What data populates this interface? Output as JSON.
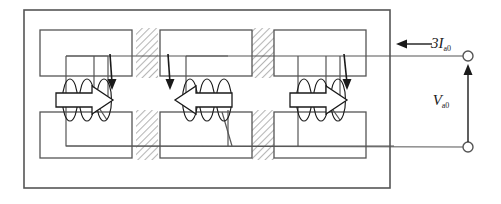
{
  "figure": {
    "type": "circuit-magnetic-diagram",
    "title": "",
    "background_color": "#ffffff",
    "line_color": "#555555",
    "hatch_color": "#bfbfbf",
    "text_color": "#1a1a1a"
  },
  "labels": {
    "current": {
      "symbol": "3I",
      "subscript": "a0",
      "full": "3Ia0"
    },
    "voltage": {
      "symbol": "V",
      "subscript": "a0",
      "full": "Va0"
    }
  },
  "outer_tank": {
    "name": "tank-enclosure",
    "x": 24,
    "y": 10,
    "width": 366,
    "height": 178
  },
  "limbs": [
    {
      "index": 0,
      "name": "limb-left",
      "flux_arrow_direction": "right",
      "current_arrow_direction": "down",
      "upper_yoke": {
        "x": 40,
        "y": 30,
        "width": 92,
        "height": 46
      },
      "lower_yoke": {
        "x": 40,
        "y": 112,
        "width": 92,
        "height": 46
      },
      "coil_turns": 3
    },
    {
      "index": 1,
      "name": "limb-center",
      "flux_arrow_direction": "left",
      "current_arrow_direction": "down",
      "upper_yoke": {
        "x": 160,
        "y": 30,
        "width": 92,
        "height": 46
      },
      "lower_yoke": {
        "x": 160,
        "y": 112,
        "width": 92,
        "height": 46
      },
      "coil_turns": 3
    },
    {
      "index": 2,
      "name": "limb-right",
      "flux_arrow_direction": "right",
      "current_arrow_direction": "down",
      "upper_yoke": {
        "x": 274,
        "y": 30,
        "width": 92,
        "height": 46
      },
      "lower_yoke": {
        "x": 274,
        "y": 112,
        "width": 92,
        "height": 46
      },
      "coil_turns": 3
    }
  ],
  "hatched_gaps": [
    {
      "name": "hatch-gap-left-upper",
      "x": 136,
      "y": 28,
      "width": 22,
      "height": 48
    },
    {
      "name": "hatch-gap-left-lower",
      "x": 136,
      "y": 110,
      "width": 22,
      "height": 48
    },
    {
      "name": "hatch-gap-right-upper",
      "x": 252,
      "y": 28,
      "width": 22,
      "height": 48
    },
    {
      "name": "hatch-gap-right-lower",
      "x": 252,
      "y": 110,
      "width": 22,
      "height": 48
    }
  ],
  "terminals": [
    {
      "name": "terminal-top",
      "cx": 468,
      "cy": 56,
      "r": 5
    },
    {
      "name": "terminal-bottom",
      "cx": 468,
      "cy": 148,
      "r": 5
    }
  ],
  "leads": {
    "top_lead_y": 56,
    "bottom_lead_y": 147,
    "current_arrow": {
      "x_from": 430,
      "x_to": 400,
      "y": 44
    },
    "voltage_arrow": {
      "x": 468,
      "y_from": 145,
      "y_to": 65
    }
  }
}
